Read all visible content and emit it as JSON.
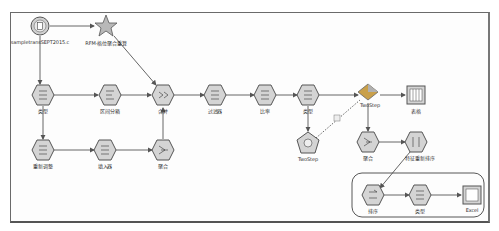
{
  "stream": {
    "title": "RFM stream",
    "nodes": [
      {
        "id": "src",
        "label": "sampletransSEPT2015.c",
        "type": "file-source",
        "x": 40,
        "y": 26
      },
      {
        "id": "rfm",
        "label": "RFM-格位聚合重算",
        "type": "supernode-star",
        "x": 106,
        "y": 26
      },
      {
        "id": "type1",
        "label": "类型",
        "type": "type",
        "x": 43,
        "y": 95
      },
      {
        "id": "binning",
        "label": "区间分箱",
        "type": "binning",
        "x": 110,
        "y": 95
      },
      {
        "id": "merge",
        "label": "合并",
        "type": "merge",
        "x": 163,
        "y": 95
      },
      {
        "id": "filter",
        "label": "过滤器",
        "type": "filter",
        "x": 215,
        "y": 95
      },
      {
        "id": "ratio",
        "label": "比率",
        "type": "derive",
        "x": 265,
        "y": 95
      },
      {
        "id": "type2",
        "label": "类型",
        "type": "type",
        "x": 308,
        "y": 95
      },
      {
        "id": "twostep_nugget",
        "label": "TwoStep",
        "type": "model-nugget",
        "x": 368,
        "y": 93
      },
      {
        "id": "table",
        "label": "表格",
        "type": "table",
        "x": 416,
        "y": 95
      },
      {
        "id": "reclass",
        "label": "重新调整",
        "type": "reclassify",
        "x": 43,
        "y": 150
      },
      {
        "id": "filler",
        "label": "填入器",
        "type": "filler",
        "x": 105,
        "y": 150
      },
      {
        "id": "agg1",
        "label": "聚合",
        "type": "aggregate",
        "x": 163,
        "y": 150
      },
      {
        "id": "twostep",
        "label": "TwoStep",
        "type": "twostep-model",
        "x": 308,
        "y": 143
      },
      {
        "id": "agg2",
        "label": "聚合",
        "type": "aggregate",
        "x": 368,
        "y": 142
      },
      {
        "id": "reorder",
        "label": "特征重新排序",
        "type": "field-reorder",
        "x": 416,
        "y": 142
      },
      {
        "id": "sort",
        "label": "排序",
        "type": "sort",
        "x": 373,
        "y": 195
      },
      {
        "id": "type3",
        "label": "类型",
        "type": "type",
        "x": 420,
        "y": 195
      },
      {
        "id": "excel",
        "label": "Excel",
        "type": "excel-export",
        "x": 472,
        "y": 195
      }
    ],
    "edges": [
      [
        "src",
        "rfm"
      ],
      [
        "src",
        "type1"
      ],
      [
        "rfm",
        "merge"
      ],
      [
        "type1",
        "binning"
      ],
      [
        "binning",
        "merge"
      ],
      [
        "merge",
        "filter"
      ],
      [
        "filter",
        "ratio"
      ],
      [
        "ratio",
        "type2"
      ],
      [
        "type2",
        "twostep_nugget"
      ],
      [
        "twostep_nugget",
        "table"
      ],
      [
        "type1",
        "reclass"
      ],
      [
        "reclass",
        "filler"
      ],
      [
        "filler",
        "agg1"
      ],
      [
        "agg1",
        "merge"
      ],
      [
        "type2",
        "twostep"
      ],
      [
        "twostep_nugget",
        "agg2"
      ],
      [
        "agg2",
        "reorder"
      ],
      [
        "reorder",
        "sort"
      ],
      [
        "sort",
        "type3"
      ],
      [
        "type3",
        "excel"
      ]
    ],
    "model_link": {
      "from": "twostep",
      "to": "twostep_nugget",
      "style": "dashed"
    }
  },
  "colors": {
    "node_fill": "#d8d8d8",
    "node_stroke": "#555555",
    "edge": "#555555",
    "nugget": "#c9a04a",
    "frame": "#6a6a6a"
  }
}
